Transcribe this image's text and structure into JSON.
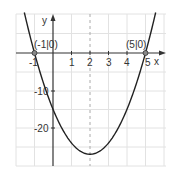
{
  "chart_data": {
    "type": "line",
    "title": "",
    "function": "f(x) = 3(x+1)(x-5)",
    "xlabel": "x",
    "ylabel": "y",
    "xlim": [
      -2,
      6
    ],
    "ylim": [
      -30,
      8
    ],
    "grid": true,
    "x_ticks": [
      "-1",
      "1",
      "2",
      "3",
      "4",
      "5"
    ],
    "y_ticks": [
      "-10",
      "-20"
    ],
    "annotations": [
      {
        "label": "(-1|0)",
        "x": -1,
        "y": 0
      },
      {
        "label": "(5|0)",
        "x": 5,
        "y": 0
      }
    ],
    "axis_of_symmetry": {
      "x": 2,
      "style": "dashed"
    },
    "series": [
      {
        "name": "parabola",
        "x": [
          -1.5,
          -1,
          0,
          1,
          2,
          3,
          4,
          5,
          5.5
        ],
        "values": [
          9.75,
          0,
          -15,
          -24,
          -27,
          -24,
          -15,
          0,
          9.75
        ]
      }
    ],
    "vertex": {
      "x": 2,
      "y": -27
    }
  },
  "labels": {
    "x_axis": "x",
    "y_axis": "y",
    "root_left": "(-1|0)",
    "root_right": "(5|0)",
    "tick_x_m1": "-1",
    "tick_x_1": "1",
    "tick_x_2": "2",
    "tick_x_3": "3",
    "tick_x_4": "4",
    "tick_x_5": "5",
    "tick_y_m10": "-10",
    "tick_y_m20": "-20"
  }
}
